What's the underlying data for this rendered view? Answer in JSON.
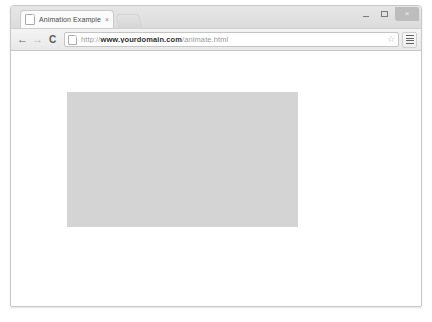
{
  "window": {
    "controls": {
      "minimize_label": "–",
      "maximize_label": "",
      "close_label": "×"
    }
  },
  "tabstrip": {
    "tabs": [
      {
        "title": "Animation Example",
        "close_label": "×",
        "favicon": "page-icon",
        "active": true
      }
    ]
  },
  "toolbar": {
    "back_label": "←",
    "forward_label": "→",
    "reload_label": "C",
    "bookmark_label": "☆",
    "menu_label": "menu-icon",
    "url": {
      "scheme": "http://",
      "host": "www.yourdomain.com",
      "path": "/animate.html",
      "full": "http://www.yourdomain.com/animate.html",
      "placeholder": "Search Google or type URL"
    }
  },
  "page": {
    "title": "Animation Example",
    "box": {
      "name": "animated-box",
      "color": "#d4d4d4",
      "width_px": 231,
      "height_px": 135,
      "left_px": 56,
      "top_px": 41,
      "text": ""
    }
  },
  "colors": {
    "window_chrome": "#e6e6e6",
    "toolbar": "#f0f0f0",
    "page_background": "#ffffff",
    "box_fill": "#d4d4d4",
    "border": "#c8c8c8"
  }
}
